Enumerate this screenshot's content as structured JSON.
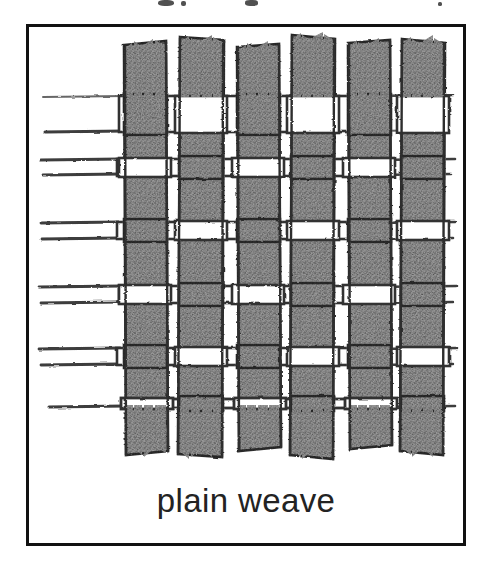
{
  "page": {
    "background_color": "#ffffff",
    "width": 482,
    "height": 570
  },
  "figure": {
    "caption": "plain weave",
    "caption_color": "#232323",
    "frame_color": "#111111",
    "frame_border_width": 3,
    "illustration_kind": "hand-drawn pencil sketch of woven fabric structure",
    "medium": "pencil / graphite shading on white paper"
  },
  "top_clipped_text": {
    "description": "faint cut-off descenders of a text line above the framed figure",
    "fragments": [
      {
        "x": 158,
        "y": 0,
        "w": 16,
        "h": 6
      },
      {
        "x": 181,
        "y": 1,
        "w": 5,
        "h": 5
      },
      {
        "x": 245,
        "y": 0,
        "w": 13,
        "h": 6
      },
      {
        "x": 438,
        "y": 2,
        "w": 4,
        "h": 4
      }
    ]
  },
  "chart_data": {
    "type": "diagram",
    "title": "plain weave",
    "structure": {
      "weave_name": "plain weave",
      "warp_count": 6,
      "weft_count": 6,
      "interlacing_rule": "over-one/under-one, offset by one on each successive row",
      "warp_orientation": "vertical",
      "weft_orientation": "horizontal"
    },
    "style": {
      "strip_fill": "#8e8e8e",
      "strip_outline": "#2a2a2a",
      "gap_fill": "#ffffff",
      "line_color": "#3a3a3a",
      "texture": "granular pencil stipple"
    },
    "warps": [
      {
        "index": 0,
        "x": 93,
        "width": 44,
        "top": 18,
        "bottom": 424,
        "frayed_top": true,
        "frayed_bottom": true
      },
      {
        "index": 1,
        "x": 150,
        "width": 44,
        "top": 10,
        "bottom": 430,
        "frayed_top": true,
        "frayed_bottom": true
      },
      {
        "index": 2,
        "x": 207,
        "width": 44,
        "top": 20,
        "bottom": 420,
        "frayed_top": true,
        "frayed_bottom": true
      },
      {
        "index": 3,
        "x": 262,
        "width": 44,
        "top": 8,
        "bottom": 432,
        "frayed_top": true,
        "frayed_bottom": true
      },
      {
        "index": 4,
        "x": 318,
        "width": 44,
        "top": 16,
        "bottom": 418,
        "frayed_top": true,
        "frayed_bottom": true
      },
      {
        "index": 5,
        "x": 372,
        "width": 44,
        "top": 12,
        "bottom": 428,
        "frayed_top": true,
        "frayed_bottom": true
      }
    ],
    "wefts": [
      {
        "index": 0,
        "y": 66,
        "height": 42,
        "left_tail": true,
        "right_tail": true
      },
      {
        "index": 1,
        "y": 130,
        "height": 42,
        "left_tail": true,
        "right_tail": true
      },
      {
        "index": 2,
        "y": 194,
        "height": 42,
        "left_tail": true,
        "right_tail": true
      },
      {
        "index": 3,
        "y": 256,
        "height": 42,
        "left_tail": true,
        "right_tail": true
      },
      {
        "index": 4,
        "y": 318,
        "height": 42,
        "left_tail": true,
        "right_tail": true
      },
      {
        "index": 5,
        "y": 376,
        "height": 36,
        "left_tail": true,
        "right_tail": true
      }
    ],
    "over_under_matrix": [
      [
        "warp",
        "weft",
        "warp",
        "weft",
        "warp",
        "weft"
      ],
      [
        "weft",
        "warp",
        "weft",
        "warp",
        "weft",
        "warp"
      ],
      [
        "warp",
        "weft",
        "warp",
        "weft",
        "warp",
        "weft"
      ],
      [
        "weft",
        "warp",
        "weft",
        "warp",
        "weft",
        "warp"
      ],
      [
        "warp",
        "weft",
        "warp",
        "weft",
        "warp",
        "weft"
      ],
      [
        "weft",
        "warp",
        "weft",
        "warp",
        "weft",
        "warp"
      ]
    ]
  }
}
